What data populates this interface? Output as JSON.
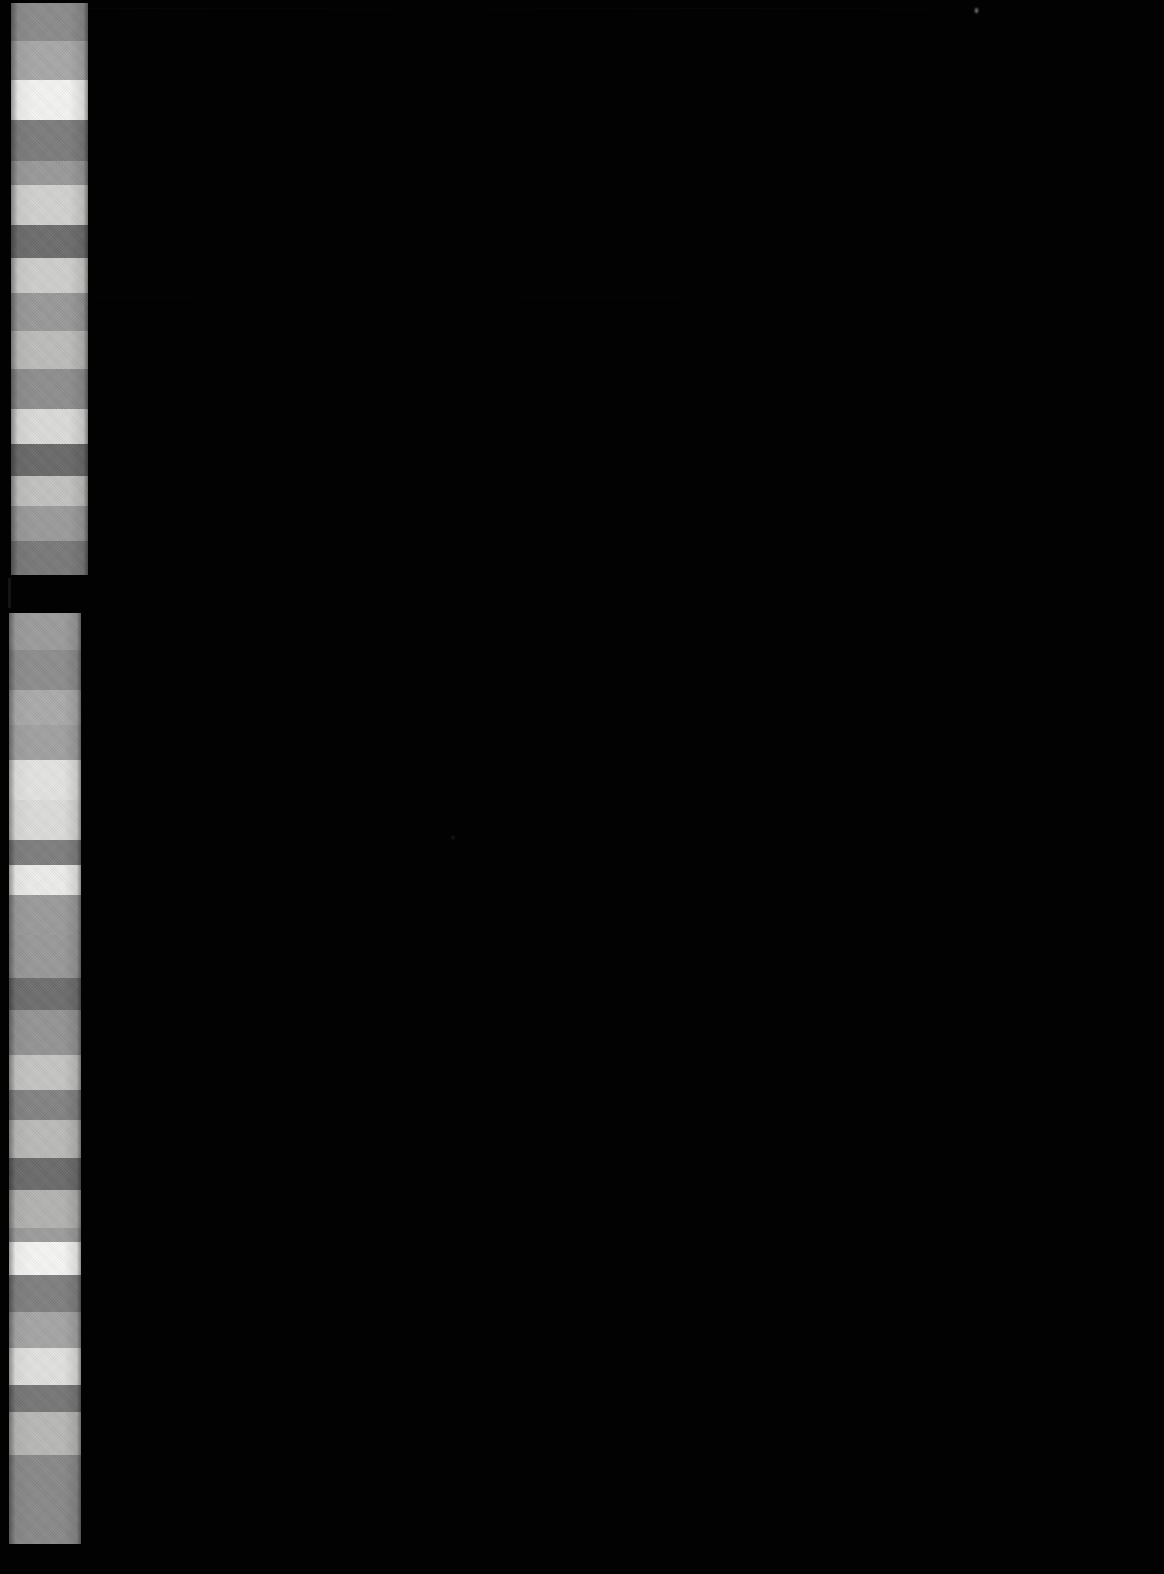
{
  "document": {
    "kind": "grayscale-step-wedge-scan",
    "background_color": "#020202",
    "width_px": 1164,
    "height_px": 1574,
    "description": "Scanned microfilm / densitometer calibration target: two vertical stepped grayscale wedges at the left edge over an unexposed black field."
  },
  "targets": [
    {
      "id": "wedge-upper",
      "label": "Upper step wedge",
      "x": 11,
      "y": 3,
      "width": 77,
      "height": 572,
      "step_count": 16,
      "steps": [
        {
          "index": 1,
          "color": "#8c8c8c",
          "height": 38
        },
        {
          "index": 2,
          "color": "#a8a8a8",
          "height": 39
        },
        {
          "index": 3,
          "color": "#f4f4f2",
          "height": 40
        },
        {
          "index": 4,
          "color": "#7d7d7d",
          "height": 41
        },
        {
          "index": 5,
          "color": "#9b9b9b",
          "height": 24
        },
        {
          "index": 6,
          "color": "#d2d2d0",
          "height": 40
        },
        {
          "index": 7,
          "color": "#6e6e6e",
          "height": 33
        },
        {
          "index": 8,
          "color": "#cfcfcd",
          "height": 35
        },
        {
          "index": 9,
          "color": "#9a9a9a",
          "height": 38
        },
        {
          "index": 10,
          "color": "#bdbdbb",
          "height": 38
        },
        {
          "index": 11,
          "color": "#8f8f8f",
          "height": 40
        },
        {
          "index": 12,
          "color": "#dcdcda",
          "height": 35
        },
        {
          "index": 13,
          "color": "#6a6a6a",
          "height": 32
        },
        {
          "index": 14,
          "color": "#c3c3c1",
          "height": 30
        },
        {
          "index": 15,
          "color": "#9c9c9c",
          "height": 35
        },
        {
          "index": 16,
          "color": "#7a7a7a",
          "height": 38
        }
      ]
    },
    {
      "id": "wedge-lower",
      "label": "Lower step wedge",
      "x": 9,
      "y": 613,
      "width": 72,
      "height": 961,
      "step_count": 25,
      "steps": [
        {
          "index": 1,
          "color": "#9d9d9d",
          "height": 37
        },
        {
          "index": 2,
          "color": "#8e8e8e",
          "height": 40
        },
        {
          "index": 3,
          "color": "#ababab",
          "height": 35
        },
        {
          "index": 4,
          "color": "#a2a2a2",
          "height": 35
        },
        {
          "index": 5,
          "color": "#e4e4e2",
          "height": 40
        },
        {
          "index": 6,
          "color": "#dddddb",
          "height": 40
        },
        {
          "index": 7,
          "color": "#7f7f7f",
          "height": 25
        },
        {
          "index": 8,
          "color": "#ededeb",
          "height": 30
        },
        {
          "index": 9,
          "color": "#9c9c9c",
          "height": 40
        },
        {
          "index": 10,
          "color": "#9a9a9a",
          "height": 43
        },
        {
          "index": 11,
          "color": "#6f6f6f",
          "height": 32
        },
        {
          "index": 12,
          "color": "#959595",
          "height": 45
        },
        {
          "index": 13,
          "color": "#c6c6c4",
          "height": 35
        },
        {
          "index": 14,
          "color": "#848484",
          "height": 30
        },
        {
          "index": 15,
          "color": "#bbbbb9",
          "height": 38
        },
        {
          "index": 16,
          "color": "#6c6c6c",
          "height": 32
        },
        {
          "index": 17,
          "color": "#b4b4b2",
          "height": 38
        },
        {
          "index": 18,
          "color": "#9e9e9e",
          "height": 14
        },
        {
          "index": 19,
          "color": "#f6f6f4",
          "height": 33
        },
        {
          "index": 20,
          "color": "#808080",
          "height": 37
        },
        {
          "index": 21,
          "color": "#a6a6a6",
          "height": 36
        },
        {
          "index": 22,
          "color": "#e2e2e0",
          "height": 37
        },
        {
          "index": 23,
          "color": "#787878",
          "height": 27
        },
        {
          "index": 24,
          "color": "#b9b9b7",
          "height": 43
        },
        {
          "index": 25,
          "color": "#8a8a8a",
          "height": 89
        }
      ]
    }
  ],
  "artifacts": {
    "streaks": [
      {
        "id": "streak-top",
        "y": 8,
        "width": 1164,
        "opacity": 0.3
      },
      {
        "id": "streak-upper",
        "y": 297,
        "width": 980,
        "opacity": 0.22
      },
      {
        "id": "streak-mid",
        "y": 393,
        "width": 760,
        "opacity": 0.12
      },
      {
        "id": "streak-lower",
        "y": 905,
        "width": 640,
        "opacity": 0.1
      }
    ],
    "hot_pixels": [
      {
        "id": "hot-pixel-1",
        "x": 975,
        "y": 10
      },
      {
        "id": "hot-pixel-2",
        "x": 452,
        "y": 838
      }
    ],
    "gap": {
      "id": "wedge-gap",
      "y": 575,
      "height": 38,
      "note": "unexposed break between the two wedge strips"
    }
  }
}
